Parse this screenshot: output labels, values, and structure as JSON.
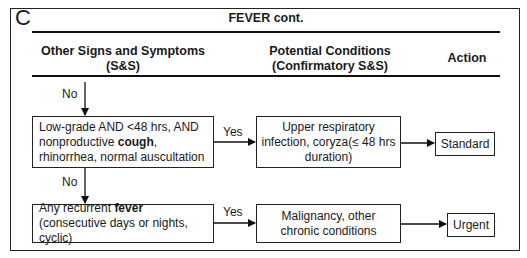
{
  "panel": {
    "letter": "C",
    "title": "FEVER cont."
  },
  "columns": {
    "signs_line1": "Other Signs and Symptoms",
    "signs_line2": "(S&S)",
    "conditions_line1": "Potential Conditions",
    "conditions_line2": "(Confirmatory S&S)",
    "action": "Action"
  },
  "flow": {
    "no_label_1": "No",
    "no_label_2": "No",
    "yes_label_1": "Yes",
    "yes_label_2": "Yes",
    "step1": {
      "text_a": "Low-grade AND <48 hrs, AND nonproductive ",
      "bold": "cough",
      "text_b": ", rhinorrhea, normal auscultation",
      "condition": "Upper respiratory infection, coryza(≤ 48 hrs duration)",
      "action": "Standard"
    },
    "step2": {
      "text_a": "Any recurrent ",
      "bold": "fever",
      "text_b": " (consecutive days or nights, cyclic)",
      "condition": "Malignancy, other chronic conditions",
      "action": "Urgent"
    }
  }
}
